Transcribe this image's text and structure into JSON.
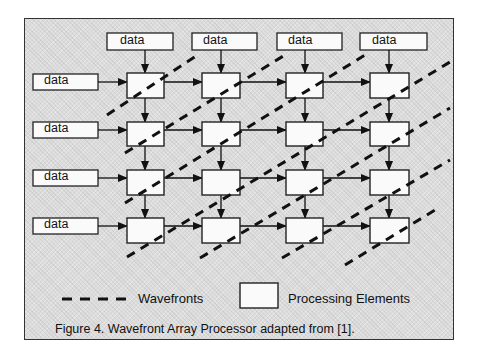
{
  "figure": {
    "caption": "Figure 4.  Wavefront Array Processor adapted from [1].",
    "grid": {
      "rows": 4,
      "cols": 4
    },
    "top_inputs": [
      "data",
      "data",
      "data",
      "data"
    ],
    "left_inputs": [
      "data",
      "data",
      "data",
      "data"
    ],
    "legend": {
      "wavefronts_label": "Wavefronts",
      "processing_elements_label": "Processing Elements"
    }
  }
}
